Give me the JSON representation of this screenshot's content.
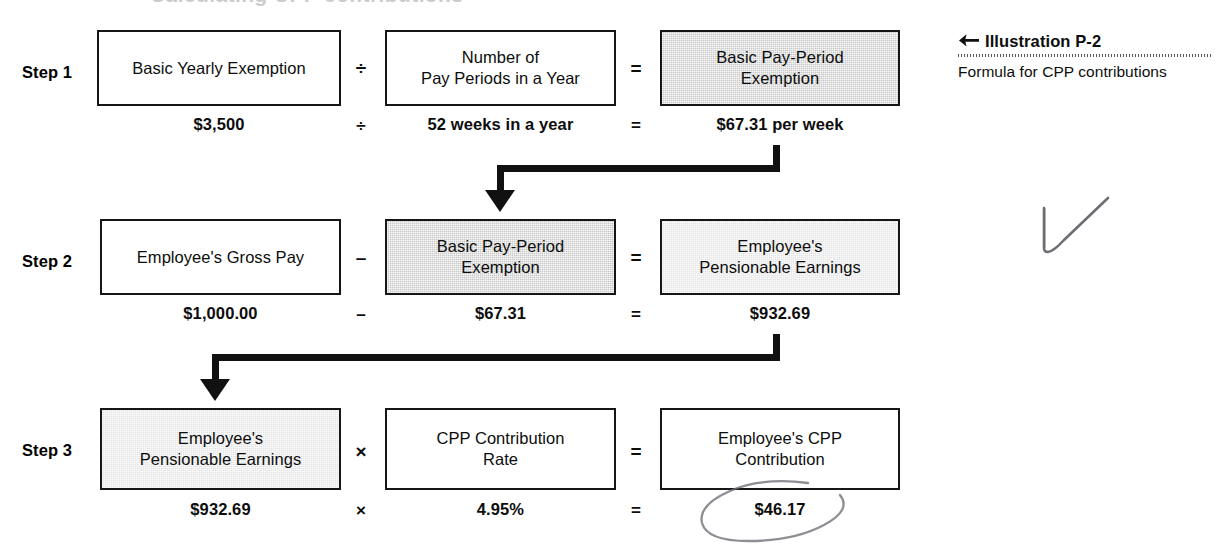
{
  "page": {
    "background": "#ffffff",
    "cut_off_top_text": "Calculating CPP contributions",
    "ink_color": "#111111",
    "fill_dark": "#c9c9c9",
    "fill_light": "#e3e3e3"
  },
  "illustration": {
    "arrow_icon": "left-arrow-icon",
    "title": "Illustration P-2",
    "subtitle": "Formula for CPP contributions"
  },
  "steps": [
    {
      "label": "Step 1",
      "boxes": [
        {
          "text": "Basic Yearly Exemption",
          "fill": "none"
        },
        {
          "text": "Number of\nPay Periods in a Year",
          "fill": "none"
        },
        {
          "text": "Basic Pay-Period\nExemption",
          "fill": "dark"
        }
      ],
      "operators": [
        "÷",
        "="
      ],
      "values": [
        "$3,500",
        "52 weeks in a year",
        "$67.31 per week"
      ],
      "value_operators": [
        "÷",
        "="
      ]
    },
    {
      "label": "Step 2",
      "boxes": [
        {
          "text": "Employee's Gross Pay",
          "fill": "none"
        },
        {
          "text": "Basic Pay-Period\nExemption",
          "fill": "dark"
        },
        {
          "text": "Employee's\nPensionable Earnings",
          "fill": "light"
        }
      ],
      "operators": [
        "–",
        "="
      ],
      "values": [
        "$1,000.00",
        "$67.31",
        "$932.69"
      ],
      "value_operators": [
        "–",
        "="
      ]
    },
    {
      "label": "Step 3",
      "boxes": [
        {
          "text": "Employee's\nPensionable Earnings",
          "fill": "light"
        },
        {
          "text": "CPP Contribution\nRate",
          "fill": "none"
        },
        {
          "text": "Employee's CPP\nContribution",
          "fill": "none"
        }
      ],
      "operators": [
        "×",
        "="
      ],
      "values": [
        "$932.69",
        "4.95%",
        "$46.17"
      ],
      "value_operators": [
        "×",
        "="
      ]
    }
  ],
  "connectors": [
    {
      "name": "step1-to-step2",
      "from": "Basic Pay-Period Exemption result",
      "to": "Step 2 Basic Pay-Period Exemption box"
    },
    {
      "name": "step2-to-step3",
      "from": "Employee's Pensionable Earnings result",
      "to": "Step 3 Employee's Pensionable Earnings box"
    }
  ],
  "annotations": [
    {
      "name": "pencil-checkmark",
      "kind": "checkmark"
    },
    {
      "name": "pencil-ellipse",
      "kind": "ellipse",
      "circles": "$46.17"
    }
  ]
}
